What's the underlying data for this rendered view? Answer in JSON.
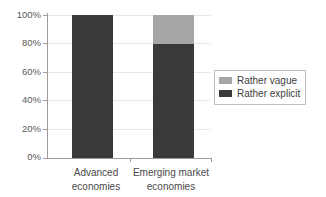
{
  "chart_data": {
    "type": "bar",
    "subtype": "stacked-column-100",
    "title": "",
    "xlabel": "",
    "ylabel": "",
    "ylim": [
      0,
      100
    ],
    "yticks": [
      0,
      20,
      40,
      60,
      80,
      100
    ],
    "ytick_labels": [
      "0%",
      "20%",
      "40%",
      "60%",
      "80%",
      "100%"
    ],
    "grid": true,
    "grid_axis": "y",
    "legend_position": "right",
    "categories": [
      "Advanced economies",
      "Emerging market economies"
    ],
    "category_lines": [
      [
        "Advanced",
        "economies"
      ],
      [
        "Emerging market",
        "economies"
      ]
    ],
    "series": [
      {
        "name": "Rather vague",
        "color": "#a6a6a6",
        "values": [
          0,
          20
        ]
      },
      {
        "name": "Rather explicit",
        "color": "#3a3a3a",
        "values": [
          100,
          80
        ]
      }
    ],
    "stack_order": [
      "Rather explicit",
      "Rather vague"
    ],
    "units": "percent"
  },
  "axis": {
    "y_tick_labels": [
      "100%",
      "80%",
      "60%",
      "40%",
      "20%",
      "0%"
    ]
  },
  "legend": {
    "items": [
      {
        "label": "Rather vague",
        "color": "#a6a6a6"
      },
      {
        "label": "Rather explicit",
        "color": "#3a3a3a"
      }
    ]
  },
  "colors": {
    "vague": "#a6a6a6",
    "explicit": "#3a3a3a",
    "axis": "#9c9c9c",
    "grid": "#e8e8e8",
    "text": "#4a4a4a",
    "legend_border": "#bfbfbf",
    "background": "#ffffff"
  }
}
